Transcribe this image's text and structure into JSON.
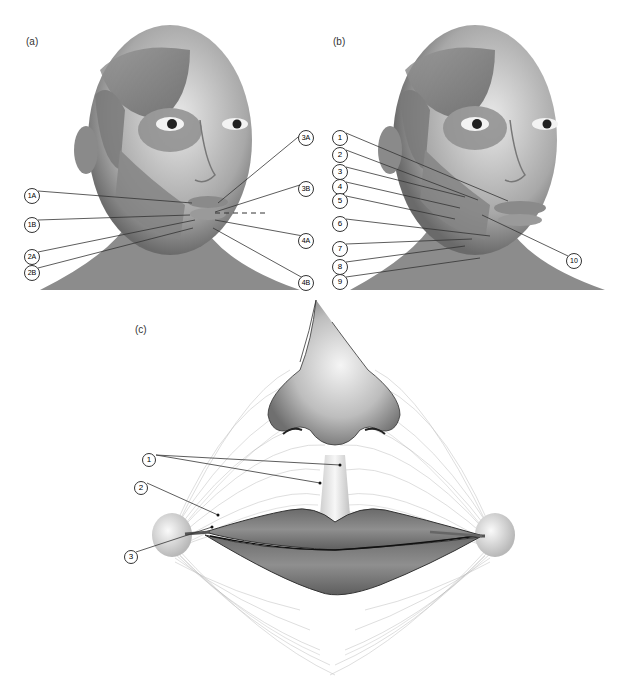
{
  "figure": {
    "panels": [
      {
        "id": "a",
        "label": "(a)",
        "description": "Frontal view of head with facial muscles exposed on one side",
        "callouts": [
          "1A",
          "1B",
          "2A",
          "2B",
          "3A",
          "3B",
          "4A",
          "4B"
        ]
      },
      {
        "id": "b",
        "label": "(b)",
        "description": "Frontal view of head with facial muscles exposed, numbered muscle labels",
        "callouts": [
          "1",
          "2",
          "3",
          "4",
          "5",
          "6",
          "7",
          "8",
          "9",
          "10"
        ]
      },
      {
        "id": "c",
        "label": "(c)",
        "description": "Schematic of orbicularis oris muscle fibers around lips and nose",
        "callouts": [
          "1",
          "2",
          "3"
        ]
      }
    ]
  },
  "colors": {
    "background": "#ffffff",
    "skin_light": "#e6e6e6",
    "skin_mid": "#b5b5b5",
    "skin_dark": "#6e6e6e",
    "lip": "#7a7a7a",
    "line": "#333333"
  }
}
